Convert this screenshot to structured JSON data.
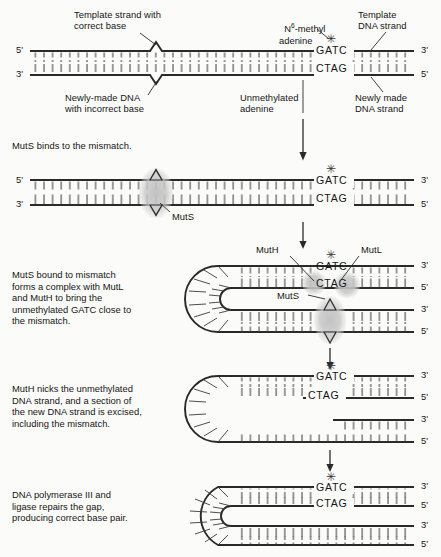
{
  "figure": {
    "background": "#fbfbf9",
    "ink": "#151515",
    "protein_fill": "#c9c9c9",
    "sequence_top": "GATC",
    "sequence_bottom": "CTAG",
    "methyl_mark": "✳",
    "end_5": "5'",
    "end_3": "3'"
  },
  "panel1": {
    "labels": {
      "template_correct": "Template strand with\ncorrect base",
      "methyl_adenine_pre": "N",
      "methyl_adenine_sup": "6",
      "methyl_adenine_post": "-methyl\nadenine",
      "template_strand": "Template\nDNA strand",
      "newly_made_incorrect": "Newly-made DNA\nwith incorrect base",
      "unmethylated_adenine": "Unmethylated\nadenine",
      "newly_made_strand": "Newly made\nDNA strand"
    },
    "ends": {
      "left_top": "5'",
      "left_bottom": "3'",
      "right_top": "3'",
      "right_bottom": "5'"
    },
    "sequence_top": "GATC",
    "sequence_bottom": "CTAG"
  },
  "panel2": {
    "caption": "MutS binds to the mismatch.",
    "protein_label": "MutS",
    "ends": {
      "left_top": "5'",
      "left_bottom": "3'",
      "right_top": "3'",
      "right_bottom": "5'"
    },
    "sequence_top": "GATC",
    "sequence_bottom": "CTAG"
  },
  "panel3": {
    "caption": "MutS bound to mismatch\nforms a complex with MutL\nand MutH to bring the\nunmethylated GATC close to\nthe mismatch.",
    "protein_labels": {
      "muth": "MutH",
      "mutl": "MutL",
      "muts": "MutS"
    },
    "ends": {
      "r1": "3'",
      "r2": "5'",
      "r3": "3'",
      "r4": "5'"
    },
    "sequence_top": "GATC",
    "sequence_bottom": "CTAG"
  },
  "panel4": {
    "caption": "MutH nicks the unmethylated\nDNA strand, and a section of\nthe new DNA strand is excised,\nincluding the mismatch.",
    "ends": {
      "r1": "3'",
      "r2": "5'",
      "r3": "3'",
      "r4": "5'"
    },
    "sequence_top": "GATC",
    "sequence_bottom": "CTAG"
  },
  "panel5": {
    "caption": "DNA polymerase III and\nligase repairs the gap,\nproducing correct base pair.",
    "ends": {
      "r1": "3'",
      "r2": "5'",
      "r3": "3'",
      "r4": "5'"
    },
    "sequence_top": "GATC",
    "sequence_bottom": "CTAG"
  }
}
